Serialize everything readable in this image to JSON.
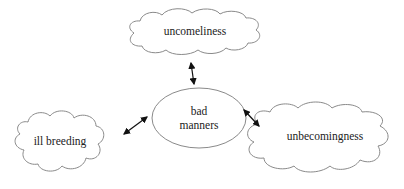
{
  "diagram": {
    "center": {
      "label_line1": "bad",
      "label_line2": "manners",
      "shape": "ellipse"
    },
    "nodes": [
      {
        "id": "top",
        "label": "uncomeliness",
        "shape": "cloud"
      },
      {
        "id": "left",
        "label": "ill breeding",
        "shape": "cloud"
      },
      {
        "id": "right",
        "label": "unbecomingness",
        "shape": "cloud"
      }
    ],
    "edges": [
      {
        "from": "center",
        "to": "top",
        "type": "bidirectional-arrow"
      },
      {
        "from": "center",
        "to": "left",
        "type": "bidirectional-arrow"
      },
      {
        "from": "center",
        "to": "right",
        "type": "bidirectional-arrow"
      }
    ],
    "colors": {
      "stroke": "#888888",
      "arrow": "#111111",
      "text": "#222222"
    }
  }
}
